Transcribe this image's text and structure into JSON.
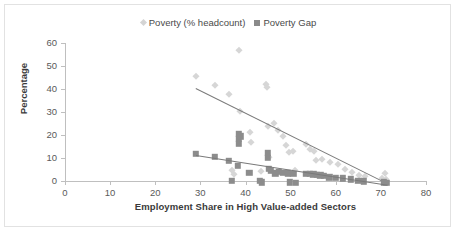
{
  "chart_data": {
    "type": "scatter",
    "title": "",
    "xlabel": "Employment Share in High Value-added Sectors",
    "ylabel": "Percentage",
    "xlim": [
      0,
      80
    ],
    "ylim": [
      0,
      60
    ],
    "xticks": [
      0,
      10,
      20,
      30,
      40,
      50,
      60,
      70,
      80
    ],
    "yticks": [
      0,
      10,
      20,
      30,
      40,
      50,
      60
    ],
    "grid": false,
    "legend_position": "top-center",
    "series": [
      {
        "name": "Poverty (% headcount)",
        "marker": "diamond",
        "color": "#d6d6d6",
        "points": [
          [
            29.0,
            45.7
          ],
          [
            33.2,
            41.8
          ],
          [
            36.4,
            38.0
          ],
          [
            38.6,
            56.8
          ],
          [
            38.8,
            30.6
          ],
          [
            37.0,
            5.0
          ],
          [
            37.4,
            3.2
          ],
          [
            40.9,
            21.1
          ],
          [
            41.3,
            17.0
          ],
          [
            44.6,
            42.2
          ],
          [
            44.8,
            41.0
          ],
          [
            45.0,
            24.0
          ],
          [
            45.2,
            10.5
          ],
          [
            43.5,
            4.3
          ],
          [
            46.3,
            25.2
          ],
          [
            47.2,
            22.0
          ],
          [
            48.4,
            19.6
          ],
          [
            49.0,
            15.5
          ],
          [
            49.6,
            12.4
          ],
          [
            50.6,
            13.0
          ],
          [
            51.0,
            5.0
          ],
          [
            53.4,
            16.3
          ],
          [
            54.4,
            14.0
          ],
          [
            55.2,
            13.2
          ],
          [
            55.6,
            9.0
          ],
          [
            57.0,
            9.4
          ],
          [
            58.8,
            8.4
          ],
          [
            60.4,
            7.2
          ],
          [
            62.0,
            5.1
          ],
          [
            63.6,
            4.0
          ],
          [
            65.2,
            2.6
          ],
          [
            66.4,
            2.2
          ],
          [
            70.2,
            1.5
          ],
          [
            71.0,
            3.4
          ],
          [
            71.2,
            1.0
          ]
        ],
        "trendline": {
          "x0": 29.0,
          "y0": 40.4,
          "x1": 70.0,
          "y1": 0.4
        }
      },
      {
        "name": "Poverty Gap",
        "marker": "square",
        "color": "#8c8c8c",
        "points": [
          [
            29.0,
            11.9
          ],
          [
            33.2,
            10.4
          ],
          [
            36.3,
            8.8
          ],
          [
            37.0,
            0.0
          ],
          [
            38.3,
            6.6
          ],
          [
            38.5,
            20.6
          ],
          [
            38.5,
            18.4
          ],
          [
            38.5,
            16.2
          ],
          [
            39.0,
            19.4
          ],
          [
            40.8,
            3.6
          ],
          [
            43.2,
            0.0
          ],
          [
            43.6,
            -0.6
          ],
          [
            45.0,
            12.2
          ],
          [
            45.0,
            10.2
          ],
          [
            45.2,
            5.2
          ],
          [
            45.6,
            4.4
          ],
          [
            46.6,
            3.4
          ],
          [
            47.4,
            4.0
          ],
          [
            48.2,
            3.6
          ],
          [
            49.4,
            3.4
          ],
          [
            49.8,
            -0.6
          ],
          [
            50.6,
            3.2
          ],
          [
            51.2,
            -0.8
          ],
          [
            53.4,
            3.2
          ],
          [
            54.2,
            3.0
          ],
          [
            55.0,
            2.9
          ],
          [
            55.8,
            2.6
          ],
          [
            56.6,
            2.4
          ],
          [
            57.4,
            2.2
          ],
          [
            58.6,
            1.6
          ],
          [
            60.0,
            1.4
          ],
          [
            61.6,
            1.2
          ],
          [
            63.4,
            0.8
          ],
          [
            65.0,
            0.2
          ],
          [
            66.2,
            -0.2
          ],
          [
            70.6,
            -0.6
          ],
          [
            71.2,
            -0.8
          ]
        ],
        "trendline": {
          "x0": 29.0,
          "y0": 11.3,
          "x1": 71.5,
          "y1": -1.6
        }
      }
    ]
  },
  "legend": {
    "items": [
      {
        "label": "Poverty (% headcount)",
        "marker": "diamond"
      },
      {
        "label": "Poverty Gap",
        "marker": "square"
      }
    ]
  },
  "axes": {
    "y_title": "Percentage",
    "x_title": "Employment Share in High Value-added Sectors"
  }
}
